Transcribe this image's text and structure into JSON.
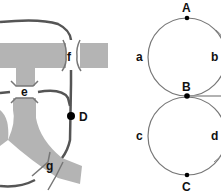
{
  "left_diagram": {
    "junction_labels": [
      "f",
      "e",
      "g"
    ],
    "node_label": "D",
    "colors": {
      "band": "#b4b4b4",
      "track": "#555555",
      "node": "#000000"
    }
  },
  "right_diagram": {
    "node_labels": {
      "top": "A",
      "middle": "B",
      "bottom": "C"
    },
    "arc_labels": {
      "upper_left": "a",
      "upper_right": "b",
      "lower_left": "c",
      "lower_right": "d"
    },
    "colors": {
      "circle": "#777777",
      "node": "#000000"
    }
  }
}
